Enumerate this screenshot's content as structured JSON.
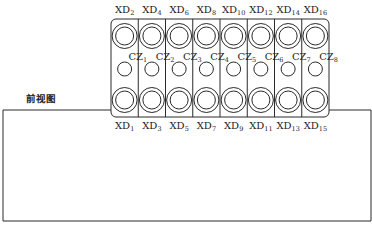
{
  "view_title": "前视图",
  "block": {
    "x": 111,
    "y": 19,
    "width": 218,
    "height": 98,
    "corner_radius": 5,
    "columns": 8
  },
  "outer_box": {
    "x": 3,
    "y": 110,
    "width": 368,
    "height": 111
  },
  "top_labels": [
    {
      "base": "XD",
      "sub": "2"
    },
    {
      "base": "XD",
      "sub": "4"
    },
    {
      "base": "XD",
      "sub": "6"
    },
    {
      "base": "XD",
      "sub": "8"
    },
    {
      "base": "XD",
      "sub": "10"
    },
    {
      "base": "XD",
      "sub": "12"
    },
    {
      "base": "XD",
      "sub": "14"
    },
    {
      "base": "XD",
      "sub": "16"
    }
  ],
  "middle_labels": [
    {
      "base": "CZ",
      "sub": "1"
    },
    {
      "base": "CZ",
      "sub": "2"
    },
    {
      "base": "CZ",
      "sub": "3"
    },
    {
      "base": "CZ",
      "sub": "4"
    },
    {
      "base": "CZ",
      "sub": "5"
    },
    {
      "base": "CZ",
      "sub": "6"
    },
    {
      "base": "CZ",
      "sub": "7"
    },
    {
      "base": "CZ",
      "sub": "8"
    }
  ],
  "bottom_labels": [
    {
      "base": "XD",
      "sub": "1"
    },
    {
      "base": "XD",
      "sub": "3"
    },
    {
      "base": "XD",
      "sub": "5"
    },
    {
      "base": "XD",
      "sub": "7"
    },
    {
      "base": "XD",
      "sub": "9"
    },
    {
      "base": "XD",
      "sub": "11"
    },
    {
      "base": "XD",
      "sub": "13"
    },
    {
      "base": "XD",
      "sub": "15"
    }
  ],
  "colors": {
    "line": "#2a2a2a",
    "text": "#222222",
    "background": "#ffffff"
  }
}
